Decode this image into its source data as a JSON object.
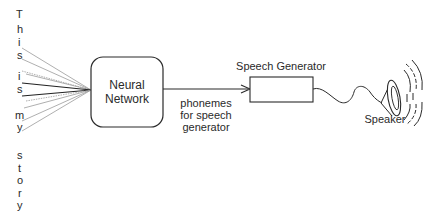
{
  "diagram": {
    "input_letters": [
      "T",
      "h",
      "i",
      "s",
      "i",
      "s",
      "m",
      "y",
      "s",
      "t",
      "o",
      "r",
      "y"
    ],
    "input_letter_positions": [
      14,
      29,
      42,
      55,
      76,
      89,
      115,
      127,
      155,
      168,
      180,
      193,
      205
    ],
    "input_sentence": "This is my story",
    "neural_network": {
      "label_line1": "Neural",
      "label_line2": "Network"
    },
    "arrow_label": {
      "line1": "phonemes",
      "line2": "for speech",
      "line3": "generator"
    },
    "speech_generator": {
      "label": "Speech Generator"
    },
    "speaker": {
      "label": "Speaker"
    },
    "colors": {
      "stroke": "#2a2a2a",
      "light_line": "#9a9a9a",
      "dark_line": "#222222"
    }
  }
}
